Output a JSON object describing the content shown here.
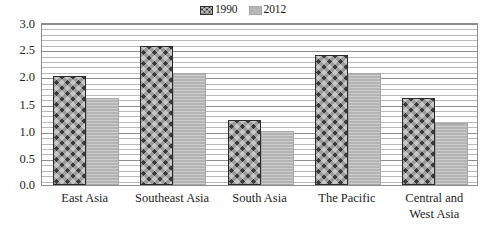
{
  "chart_data": {
    "type": "bar",
    "title": "",
    "subtitle": "",
    "xlabel": "",
    "ylabel": "",
    "categories": [
      "East Asia",
      "Southeast Asia",
      "South Asia",
      "The Pacific",
      "Central and\nWest Asia"
    ],
    "series": [
      {
        "name": "1990",
        "color": "#3a3a3a",
        "pattern": "chevron-zigzag",
        "values": [
          2.0,
          2.55,
          1.2,
          2.4,
          1.6
        ]
      },
      {
        "name": "2012",
        "color": "#b7b7b7",
        "pattern": "solid-light-gray",
        "values": [
          1.6,
          2.07,
          1.0,
          2.07,
          1.15
        ]
      }
    ],
    "ylim": [
      0.0,
      3.0
    ],
    "y_major_ticks": [
      "3.0",
      "2.5",
      "2.0",
      "1.5",
      "1.0",
      "0.5",
      "0.0"
    ],
    "y_major_values": [
      3.0,
      2.5,
      2.0,
      1.5,
      1.0,
      0.5,
      0.0
    ],
    "y_minor_interval": 0.1,
    "grid": true,
    "grid_axis": "y",
    "legend_position": "top-center",
    "frame": true
  },
  "legend": {
    "entries": [
      {
        "label": "1990",
        "swatch": "legend-swatch-1990"
      },
      {
        "label": "2012",
        "swatch": "legend-swatch-2012"
      }
    ]
  },
  "colors": {
    "series_1990": "#3a3a3a",
    "series_2012": "#b7b7b7",
    "gridline_major": "#8d8d8d",
    "gridline_minor": "#b9b9b9",
    "frame": "#8d8d8d",
    "text": "#242424",
    "background": "#ffffff"
  }
}
